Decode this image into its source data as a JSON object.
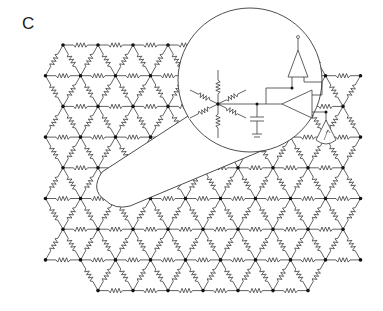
{
  "panel": {
    "label": "C"
  },
  "lattice": {
    "type": "triangular",
    "edge_component": "resistor",
    "rows": 9,
    "origin_x": 63,
    "origin_y": 45,
    "dx": 35,
    "dy": 30.7,
    "row_lengths": [
      8,
      10,
      9,
      10,
      9,
      10,
      9,
      10,
      7
    ],
    "row_offsets": [
      0,
      -0.5,
      0,
      -0.5,
      0,
      -0.5,
      0,
      -0.5,
      1
    ]
  },
  "magnifier": {
    "cx": 250,
    "cy": 80,
    "r": 72,
    "content": "node circuit: resistor star, capacitor to ground, two op-amps, sensor/antenna"
  },
  "colors": {
    "line": "#3a3a3a",
    "node": "#111111",
    "background": "#ffffff"
  }
}
